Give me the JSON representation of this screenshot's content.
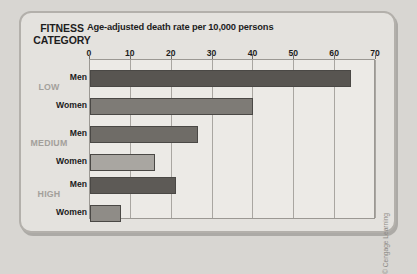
{
  "header": {
    "category_heading_line1": "FITNESS",
    "category_heading_line2": "CATEGORY",
    "title": "Age-adjusted death rate per 10,000 persons"
  },
  "credit": "© Cengage Learning",
  "colors": {
    "page_background": "#d8d6d2",
    "panel_background": "#e4e2de",
    "plot_background": "#eceae6",
    "frame_border": "#b3b0ab",
    "gridline": "#a9a6a1",
    "bar_outline": "#4a4845",
    "low_men": "#585551",
    "low_women": "#7e7b76",
    "medium_men": "#6f6c67",
    "medium_women": "#a9a6a1",
    "high_men": "#5d5a56",
    "high_women": "#8f8c87",
    "category_label_text": "#a3a09b",
    "series_label_text": "#1b1b1b"
  },
  "axis": {
    "ticks": [
      0,
      10,
      20,
      30,
      40,
      50,
      60,
      70
    ]
  },
  "chart_data": {
    "type": "bar",
    "orientation": "horizontal",
    "title": "Age-adjusted death rate per 10,000 persons",
    "xlabel": "Age-adjusted death rate per 10,000 persons",
    "ylabel": "FITNESS CATEGORY",
    "xlim": [
      0,
      70
    ],
    "xticks": [
      0,
      10,
      20,
      30,
      40,
      50,
      60,
      70
    ],
    "grid": true,
    "legend": false,
    "categories": [
      "LOW",
      "MEDIUM",
      "HIGH"
    ],
    "series": [
      {
        "name": "Men",
        "values": [
          64,
          26.5,
          21
        ]
      },
      {
        "name": "Women",
        "values": [
          40,
          16,
          7.5
        ]
      }
    ],
    "bars": [
      {
        "category": "LOW",
        "series": "Men",
        "value": 64,
        "color": "#585551"
      },
      {
        "category": "LOW",
        "series": "Women",
        "value": 40,
        "color": "#7e7b76"
      },
      {
        "category": "MEDIUM",
        "series": "Men",
        "value": 26.5,
        "color": "#6f6c67"
      },
      {
        "category": "MEDIUM",
        "series": "Women",
        "value": 16,
        "color": "#a9a6a1"
      },
      {
        "category": "HIGH",
        "series": "Men",
        "value": 21,
        "color": "#5d5a56"
      },
      {
        "category": "HIGH",
        "series": "Women",
        "value": 7.5,
        "color": "#8f8c87"
      }
    ]
  }
}
